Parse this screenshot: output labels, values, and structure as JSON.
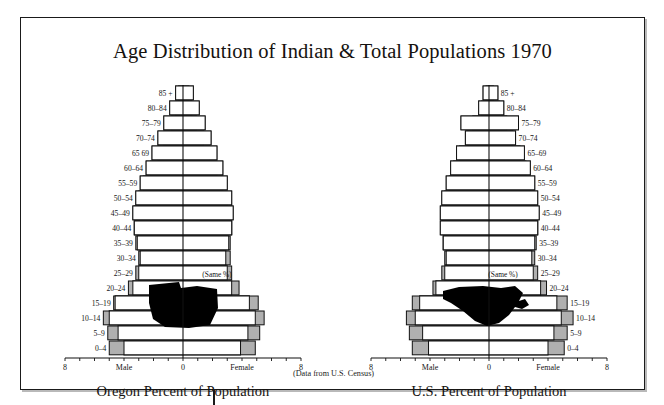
{
  "title": "Age Distribution of Indian & Total Populations 1970",
  "source_note": "(Data from U.S. Census)",
  "panels": [
    {
      "caption": "Oregon Percent of Population",
      "silhouette": "oregon-state-silhouette"
    },
    {
      "caption": "U.S. Percent of Population",
      "silhouette": "united-states-silhouette"
    }
  ],
  "axis": {
    "left_end_label": "8",
    "right_end_label": "8",
    "center_label": "0",
    "male_label": "Male",
    "female_label": "Female",
    "max": 8,
    "tick_step": 1
  },
  "same_pct_note": "(Same %)",
  "colors": {
    "indian": "#b0b0b0",
    "total": "#ffffff",
    "outline": "#111111",
    "silhouette": "#000000",
    "frame": "#1a1a1a"
  },
  "age_groups": [
    "85 +",
    "80–84",
    "75–79",
    "70–74",
    "65  69",
    "60–64",
    "55–59",
    "50–54",
    "45–49",
    "40–44",
    "35–39",
    "30–34",
    "25–29",
    "20–24",
    "15–19",
    "10–14",
    "5–9",
    "0–4"
  ],
  "chart_data": [
    {
      "type": "bar",
      "title": "Oregon Percent of Population",
      "subtitle": "Age Distribution of Indian & Total Populations 1970",
      "xlabel": "Percent of Population",
      "ylabel": "Age group",
      "orientation": "population-pyramid",
      "xlim": [
        -8,
        8
      ],
      "grid": false,
      "legend": [
        "Indian population (gray)",
        "Total population (white)"
      ],
      "categories": [
        "85 +",
        "80–84",
        "75–79",
        "70–74",
        "65  69",
        "60–64",
        "55–59",
        "50–54",
        "45–49",
        "40–44",
        "35–39",
        "30–34",
        "25–29",
        "20–24",
        "15–19",
        "10–14",
        "5–9",
        "0–4"
      ],
      "series": [
        {
          "name": "Total male",
          "side": "male",
          "group": "total",
          "values": [
            0.5,
            0.9,
            1.3,
            1.7,
            2.1,
            2.5,
            2.9,
            3.2,
            3.4,
            3.3,
            3.1,
            2.9,
            3.0,
            3.4,
            4.6,
            5.0,
            4.4,
            4.0
          ]
        },
        {
          "name": "Indian male",
          "side": "male",
          "group": "indian",
          "values": [
            0.3,
            0.5,
            0.8,
            1.3,
            1.7,
            2.2,
            2.7,
            3.0,
            3.3,
            3.3,
            3.2,
            3.0,
            3.2,
            3.7,
            4.7,
            5.4,
            5.1,
            5.0
          ]
        },
        {
          "name": "Total female",
          "side": "female",
          "group": "total",
          "values": [
            0.7,
            1.1,
            1.5,
            1.9,
            2.3,
            2.7,
            3.0,
            3.3,
            3.4,
            3.3,
            3.1,
            2.9,
            3.0,
            3.3,
            4.5,
            4.9,
            4.4,
            3.9
          ]
        },
        {
          "name": "Indian female",
          "side": "female",
          "group": "indian",
          "values": [
            0.4,
            0.6,
            0.9,
            1.4,
            1.8,
            2.3,
            2.7,
            3.0,
            3.3,
            3.3,
            3.2,
            3.2,
            3.3,
            3.8,
            5.1,
            5.5,
            5.2,
            4.9
          ]
        }
      ]
    },
    {
      "type": "bar",
      "title": "U.S. Percent of Population",
      "subtitle": "Age Distribution of Indian & Total Populations 1970",
      "xlabel": "Percent of Population",
      "ylabel": "Age group",
      "orientation": "population-pyramid",
      "xlim": [
        -8,
        8
      ],
      "grid": false,
      "legend": [
        "Indian population (gray)",
        "Total population (white)"
      ],
      "categories": [
        "85 +",
        "80–84",
        "75–79",
        "70–74",
        "65–69",
        "60–64",
        "55–59",
        "50–54",
        "45–49",
        "40–44",
        "35–39",
        "30–34",
        "25–29",
        "20–24",
        "15–19",
        "10–14",
        "5–9",
        "0–4"
      ],
      "series": [
        {
          "name": "Total male",
          "side": "male",
          "group": "total",
          "values": [
            0.4,
            0.7,
            1.9,
            1.6,
            2.2,
            2.6,
            2.9,
            3.2,
            3.3,
            3.3,
            3.1,
            2.9,
            3.0,
            3.6,
            4.7,
            5.0,
            4.5,
            4.1
          ]
        },
        {
          "name": "Indian male",
          "side": "male",
          "group": "indian",
          "values": [
            0.2,
            0.5,
            1.1,
            1.5,
            2.0,
            2.4,
            2.7,
            3.0,
            3.2,
            3.2,
            3.1,
            3.0,
            3.2,
            3.8,
            5.2,
            5.6,
            5.4,
            5.2
          ]
        },
        {
          "name": "Total female",
          "side": "female",
          "group": "total",
          "values": [
            0.6,
            1.0,
            2.0,
            1.8,
            2.4,
            2.8,
            3.1,
            3.3,
            3.4,
            3.3,
            3.1,
            2.9,
            3.0,
            3.5,
            4.6,
            4.9,
            4.4,
            4.0
          ]
        },
        {
          "name": "Indian female",
          "side": "female",
          "group": "indian",
          "values": [
            0.3,
            0.7,
            1.2,
            1.6,
            2.1,
            2.5,
            2.8,
            3.1,
            3.3,
            3.3,
            3.2,
            3.1,
            3.3,
            3.9,
            5.3,
            5.7,
            5.3,
            5.1
          ]
        }
      ]
    }
  ]
}
